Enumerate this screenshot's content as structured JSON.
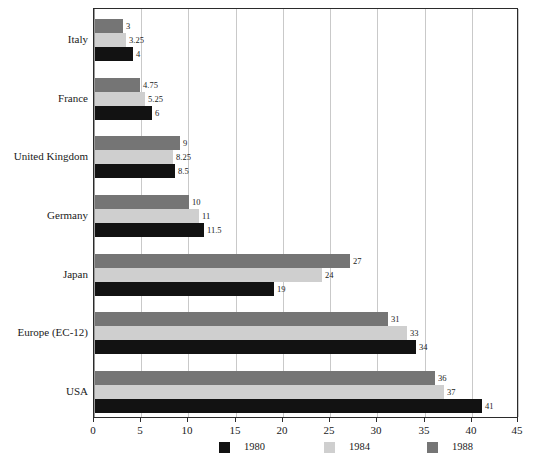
{
  "chart_data": {
    "type": "bar",
    "orientation": "horizontal",
    "title": "",
    "xlabel": "",
    "ylabel": "",
    "xlim": [
      0,
      45
    ],
    "xticks": [
      0,
      5,
      10,
      15,
      20,
      25,
      30,
      35,
      40,
      45
    ],
    "grid": true,
    "legend_position": "bottom",
    "categories": [
      "Italy",
      "France",
      "United Kingdom",
      "Germany",
      "Japan",
      "Europe (EC-12)",
      "USA"
    ],
    "series": [
      {
        "name": "1980",
        "color": "#121212",
        "values": [
          4,
          6,
          8.5,
          11.5,
          19,
          34,
          41
        ],
        "labels": [
          "4",
          "6",
          "8.5",
          "11.5",
          "19",
          "34",
          "41"
        ]
      },
      {
        "name": "1984",
        "color": "#cfcfcf",
        "values": [
          3.25,
          5.25,
          8.25,
          11,
          24,
          33,
          37
        ],
        "labels": [
          "3.25",
          "5.25",
          "8.25",
          "11",
          "24",
          "33",
          "37"
        ]
      },
      {
        "name": "1988",
        "color": "#757575",
        "values": [
          3,
          4.75,
          9,
          10,
          27,
          31,
          36
        ],
        "labels": [
          "3",
          "4.75",
          "9",
          "10",
          "27",
          "31",
          "36"
        ]
      }
    ]
  },
  "axis": {
    "tick_labels": [
      "0",
      "5",
      "10",
      "15",
      "20",
      "25",
      "30",
      "35",
      "40",
      "45"
    ]
  },
  "legend": {
    "items": [
      {
        "label": "1980",
        "key": "s1980"
      },
      {
        "label": "1984",
        "key": "s1984"
      },
      {
        "label": "1988",
        "key": "s1988"
      }
    ]
  },
  "colors": {
    "series_1980": "#121212",
    "series_1984": "#cfcfcf",
    "series_1988": "#757575",
    "gridline": "#c9c9c9",
    "frame": "#2b2b2b",
    "text": "#1a1a1a",
    "background": "#ffffff"
  }
}
